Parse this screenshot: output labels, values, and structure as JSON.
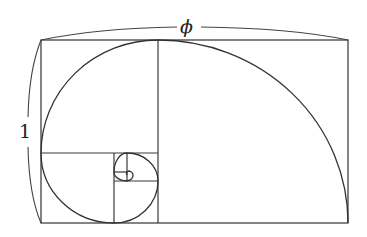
{
  "diagram": {
    "labels": {
      "width": "ϕ",
      "height": "1"
    },
    "colors": {
      "stroke": "#333333",
      "background": "#ffffff"
    },
    "rectangle": {
      "x": 41,
      "y": 40,
      "width": 307,
      "height": 183
    },
    "divisions": [
      {
        "name": "square-1-divider",
        "x1": 158,
        "y1": 40,
        "x2": 158,
        "y2": 223
      },
      {
        "name": "square-2-divider",
        "x1": 41,
        "y1": 153,
        "x2": 158,
        "y2": 153
      },
      {
        "name": "square-3-divider",
        "x1": 114,
        "y1": 153,
        "x2": 114,
        "y2": 223
      },
      {
        "name": "square-4-divider",
        "x1": 114,
        "y1": 181,
        "x2": 158,
        "y2": 181
      },
      {
        "name": "square-5-divider",
        "x1": 127,
        "y1": 153,
        "x2": 127,
        "y2": 181
      },
      {
        "name": "square-6-divider",
        "x1": 114,
        "y1": 172,
        "x2": 127,
        "y2": 172
      }
    ],
    "spiral_arcs": [
      "M 348 223 A 190 183 0 0 0 158 40",
      "M 158 40 A 117 113 0 0 0 41 153",
      "M 41 153 A 73 70 0 0 0 114 223",
      "M 114 223 A 44 42 0 0 0 158 181",
      "M 158 181 A 31 28 0 0 0 127 153",
      "M 127 153 A 13 19 0 0 0 114 172",
      "M 114 172 A 13 9 0 0 0 127 181",
      "M 127 181 A 8 6 0 0 0 133 175",
      "M 133 175 A 5 4 0 0 0 128 171",
      "M 128 171 A 3 3 0 0 0 127 175"
    ],
    "braces": {
      "top_left": "M 41 40 Q 100 28 177 27",
      "top_right": "M 201 27 Q 290 28 348 40",
      "left_upper": "M 41 40 Q 29 70 28 117",
      "left_lower": "M 28 147 Q 29 195 41 223"
    }
  }
}
